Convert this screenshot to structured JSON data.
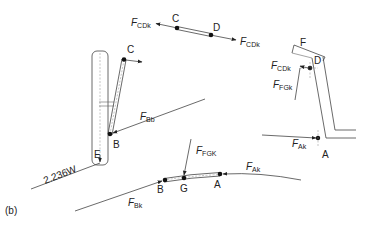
{
  "figure": {
    "panel_label": "(b)",
    "colors": {
      "line": "#444444",
      "pin": "#111111",
      "text": "#222222",
      "background": "#ffffff"
    }
  },
  "labels": {
    "top_link_C": "C",
    "top_link_D": "D",
    "F_CDk_left_main": "F",
    "F_CDk_left_sub": "CDk",
    "F_CDk_right_main": "F",
    "F_CDk_right_sub": "CDk",
    "frame_C": "C",
    "frame_B": "B",
    "frame_E": "E",
    "F_Bb_main": "F",
    "F_Bb_sub": "Bb",
    "weight_load": "2.236W",
    "bottom_B": "B",
    "bottom_G": "G",
    "bottom_A": "A",
    "F_FGK_main": "F",
    "F_FGK_sub": "FGK",
    "F_Ak_bottom_main": "F",
    "F_Ak_bottom_sub": "Ak",
    "F_Bk_main": "F",
    "F_Bk_sub": "Bk",
    "right_F": "F",
    "right_D": "D",
    "right_F_CDk_main": "F",
    "right_F_CDk_sub": "CDk",
    "right_F_FGk_main": "F",
    "right_F_FGk_sub": "FGk",
    "right_F_Ak_main": "F",
    "right_F_Ak_sub": "Ak",
    "right_A": "A"
  }
}
